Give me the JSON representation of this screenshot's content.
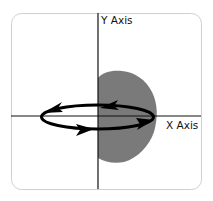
{
  "diagram": {
    "y_axis_label": "Y Axis",
    "x_axis_label": "X Axis",
    "colors": {
      "frame": "#cfcfcf",
      "axes": "#111111",
      "blob": "#7a7a7a",
      "arrows": "#000000",
      "background": "#ffffff"
    },
    "elements": [
      "rounded-frame",
      "x-axis",
      "y-axis",
      "gray-region-right-of-y-axis",
      "elliptical-orbit-with-four-arrowheads"
    ]
  }
}
